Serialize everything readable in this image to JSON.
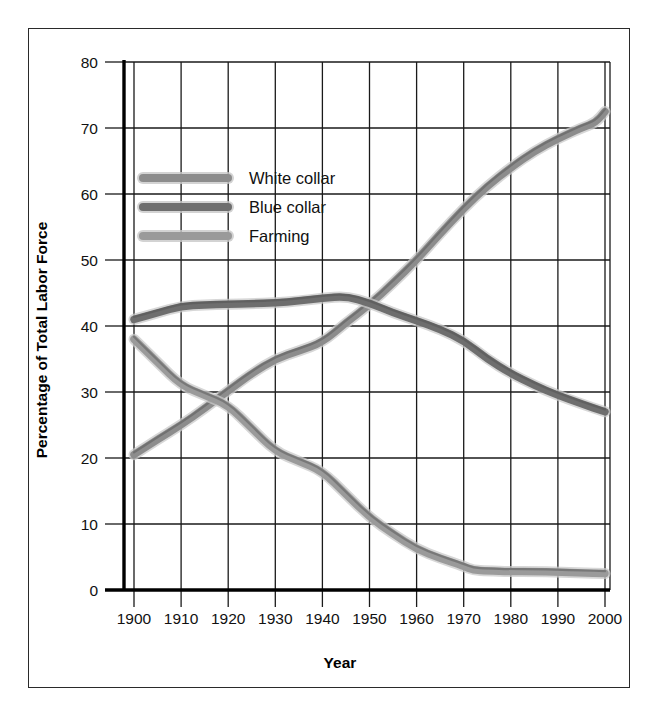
{
  "chart_data": {
    "type": "line",
    "title": "",
    "xlabel": "Year",
    "ylabel": "Percentage of Total Labor Force",
    "xlim": [
      1898,
      2002
    ],
    "ylim": [
      0,
      80
    ],
    "xticks": [
      1900,
      1910,
      1920,
      1930,
      1940,
      1950,
      1960,
      1970,
      1980,
      1990,
      2000
    ],
    "yticks": [
      0,
      10,
      20,
      30,
      40,
      50,
      60,
      70,
      80
    ],
    "grid": true,
    "legend_position": "upper-left-inside",
    "series": [
      {
        "name": "White collar",
        "color": "#8c8c8c",
        "x": [
          1900,
          1905,
          1910,
          1915,
          1920,
          1925,
          1930,
          1935,
          1940,
          1945,
          1950,
          1955,
          1960,
          1965,
          1970,
          1975,
          1980,
          1985,
          1990,
          1995,
          1998,
          2000
        ],
        "y": [
          20.5,
          22.8,
          25.0,
          27.5,
          30.2,
          32.8,
          35.0,
          36.2,
          37.5,
          40.5,
          43.2,
          46.5,
          50.0,
          54.0,
          57.8,
          61.2,
          64.0,
          66.5,
          68.4,
          70.0,
          70.8,
          72.5
        ]
      },
      {
        "name": "Blue collar",
        "color": "#6e6e6e",
        "x": [
          1900,
          1905,
          1910,
          1915,
          1920,
          1925,
          1930,
          1935,
          1940,
          1945,
          1950,
          1955,
          1960,
          1965,
          1970,
          1975,
          1980,
          1985,
          1990,
          1995,
          2000
        ],
        "y": [
          41.0,
          42.0,
          43.0,
          43.2,
          43.3,
          43.4,
          43.5,
          43.8,
          44.2,
          44.5,
          43.5,
          42.0,
          40.8,
          39.5,
          37.8,
          35.0,
          32.8,
          31.0,
          29.5,
          28.2,
          27.0
        ]
      },
      {
        "name": "Farming",
        "color": "#9a9a9a",
        "x": [
          1900,
          1905,
          1910,
          1915,
          1920,
          1925,
          1930,
          1935,
          1940,
          1945,
          1950,
          1955,
          1960,
          1965,
          1970,
          1972,
          1975,
          1980,
          1985,
          1990,
          1995,
          2000
        ],
        "y": [
          38.0,
          34.5,
          31.0,
          29.5,
          28.0,
          24.5,
          21.0,
          19.5,
          18.0,
          14.5,
          11.0,
          8.5,
          6.2,
          4.8,
          3.6,
          3.0,
          2.9,
          2.8,
          2.8,
          2.7,
          2.6,
          2.5
        ]
      }
    ]
  },
  "axes": {
    "x_title": "Year",
    "y_title": "Percentage of Total Labor Force",
    "x_tick_labels": [
      "1900",
      "1910",
      "1920",
      "1930",
      "1940",
      "1950",
      "1960",
      "1970",
      "1980",
      "1990",
      "2000"
    ],
    "y_tick_labels": [
      "80",
      "70",
      "60",
      "50",
      "40",
      "30",
      "20",
      "10",
      "0"
    ]
  },
  "legend": {
    "items": [
      {
        "label": "White collar",
        "color": "#8c8c8c"
      },
      {
        "label": "Blue collar",
        "color": "#6e6e6e"
      },
      {
        "label": "Farming",
        "color": "#9a9a9a"
      }
    ]
  },
  "colors": {
    "background": "#ffffff",
    "frame": "#2a2a2a",
    "grid": "#1a1a1a",
    "axis": "#000000",
    "text": "#111111"
  }
}
